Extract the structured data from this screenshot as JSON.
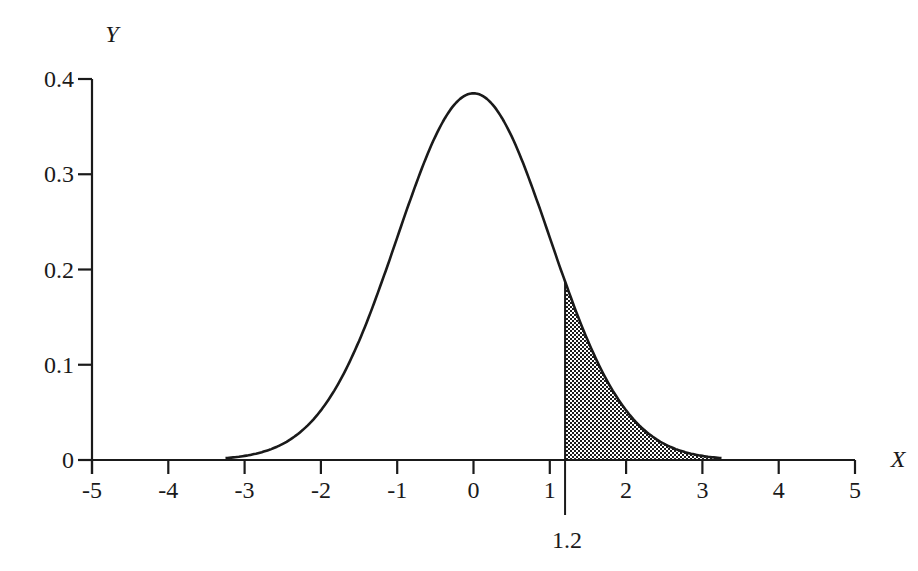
{
  "chart_data": {
    "type": "area",
    "title": "",
    "xlabel": "X",
    "ylabel": "Y",
    "xlim": [
      -5,
      5
    ],
    "ylim": [
      0,
      0.4
    ],
    "grid": false,
    "legend": null,
    "x_ticks": [
      -5,
      -4,
      -3,
      -2,
      -1,
      0,
      1,
      2,
      3,
      4,
      5
    ],
    "x_tick_labels": [
      "-5",
      "-4",
      "-3",
      "-2",
      "-1",
      "0",
      "1",
      "2",
      "3",
      "4",
      "5"
    ],
    "y_ticks": [
      0,
      0.1,
      0.2,
      0.3,
      0.4
    ],
    "y_tick_labels": [
      "0",
      "0.1",
      "0.2",
      "0.3",
      "0.4"
    ],
    "distribution": {
      "name": "normal",
      "mean": 0,
      "sd": 1
    },
    "series": [
      {
        "name": "density",
        "x": [
          -3.25,
          -3,
          -2.5,
          -2,
          -1.5,
          -1,
          -0.5,
          0,
          0.5,
          1,
          1.2,
          1.5,
          2,
          2.5,
          3,
          3.25
        ],
        "values": [
          0.002,
          0.004,
          0.018,
          0.054,
          0.13,
          0.242,
          0.352,
          0.399,
          0.352,
          0.242,
          0.194,
          0.13,
          0.054,
          0.018,
          0.004,
          0.002
        ]
      }
    ],
    "shaded_region": {
      "from": 1.2,
      "to": 3.25,
      "pattern": "checkered",
      "label": "1.2"
    },
    "annotations": [
      {
        "text": "1.2",
        "x": 1.2,
        "position": "below-axis",
        "marker": "vertical-line"
      }
    ]
  },
  "labels": {
    "x_axis": "X",
    "y_axis": "Y",
    "cut_value": "1.2"
  }
}
